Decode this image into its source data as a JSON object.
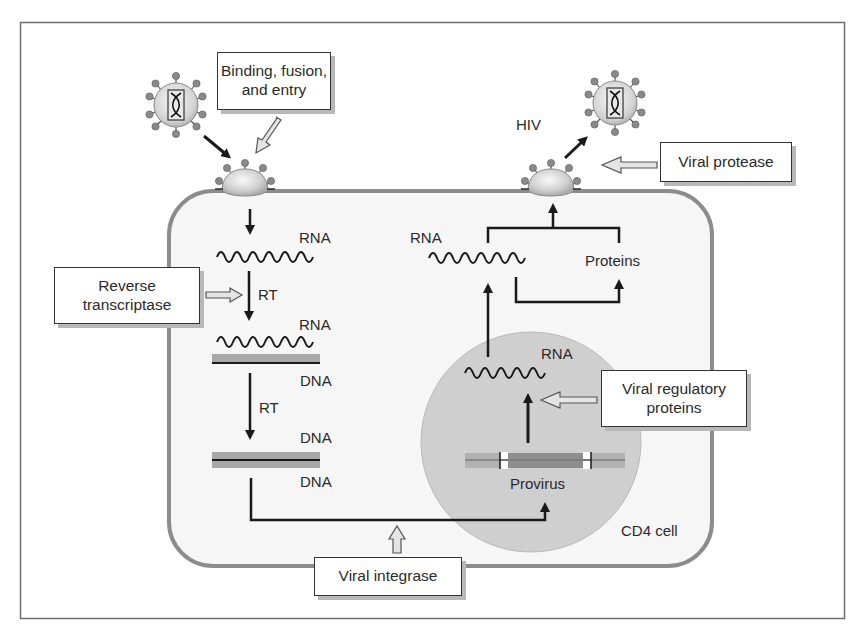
{
  "diagram": {
    "cell_label": "CD4 cell",
    "virus_label": "HIV",
    "colors": {
      "frame": "#6e6e6e",
      "cell_fill": "#f6f6f6",
      "cell_border": "#8c8c8c",
      "nucleus_fill": "#cfcfcf",
      "arrow": "#1a1a1a",
      "hollow_arrow_fill": "#e4e4e4",
      "dna_band": "#a8a8a8",
      "box_shadow": "#b8b8b8"
    },
    "callouts": {
      "binding": {
        "line1": "Binding, fusion,",
        "line2": "and entry"
      },
      "reverse_transcriptase": {
        "line1": "Reverse",
        "line2": "transcriptase"
      },
      "viral_protease": {
        "line1": "Viral protease"
      },
      "viral_regulatory": {
        "line1": "Viral regulatory",
        "line2": "proteins"
      },
      "viral_integrase": {
        "line1": "Viral integrase"
      }
    },
    "left_pathway": {
      "rna_1": "RNA",
      "rt_1": "RT",
      "rna_2": "RNA",
      "dna_1": "DNA",
      "rt_2": "RT",
      "dna_2_top": "DNA",
      "dna_2_bottom": "DNA"
    },
    "right_pathway": {
      "rna_cytoplasm": "RNA",
      "proteins": "Proteins",
      "rna_nucleus": "RNA",
      "provirus": "Provirus"
    },
    "nodes": [
      {
        "id": "free-virus-left",
        "label": "HIV virion"
      },
      {
        "id": "budding-left",
        "label": "entry site"
      },
      {
        "id": "budding-right",
        "label": "budding site"
      },
      {
        "id": "free-virus-right",
        "label": "HIV virion"
      }
    ],
    "edges": [
      {
        "from": "free-virus-left",
        "to": "budding-left"
      },
      {
        "from": "budding-left",
        "to": "RNA"
      },
      {
        "from": "RNA",
        "to": "RNA/DNA",
        "label": "RT"
      },
      {
        "from": "RNA/DNA",
        "to": "DNA/DNA",
        "label": "RT"
      },
      {
        "from": "DNA/DNA",
        "to": "Provirus"
      },
      {
        "from": "Provirus",
        "to": "RNA (nucleus)"
      },
      {
        "from": "RNA (nucleus)",
        "to": "RNA (cytoplasm)"
      },
      {
        "from": "RNA (cytoplasm)",
        "to": "Proteins"
      },
      {
        "from": "RNA (cytoplasm)",
        "to": "budding-right"
      },
      {
        "from": "Proteins",
        "to": "budding-right"
      },
      {
        "from": "budding-right",
        "to": "free-virus-right"
      }
    ]
  }
}
